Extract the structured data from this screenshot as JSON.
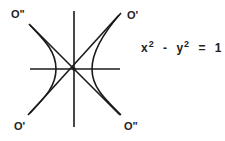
{
  "diagram": {
    "type": "hyperbola-with-asymptotes",
    "stroke_color": "#1a1a1a",
    "labels": {
      "top_left": "O\"",
      "top_right": "O'",
      "bottom_left": "O'",
      "bottom_right": "O\""
    },
    "equation": {
      "x_var": "x",
      "x_exp": "2",
      "minus": "-",
      "y_var": "y",
      "y_exp": "2",
      "equals": "=",
      "rhs": "1"
    }
  }
}
